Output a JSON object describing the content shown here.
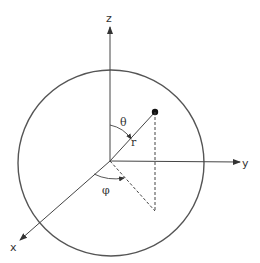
{
  "diagram": {
    "type": "spherical-coordinates",
    "axes": {
      "z": {
        "label": "z"
      },
      "y": {
        "label": "y"
      },
      "x": {
        "label": "x"
      }
    },
    "angles": {
      "theta": {
        "label": "θ"
      },
      "phi": {
        "label": "φ"
      }
    },
    "radius_label": "r",
    "colors": {
      "line": "#444444",
      "circle": "#555555",
      "point": "#111111",
      "background": "#ffffff"
    }
  }
}
